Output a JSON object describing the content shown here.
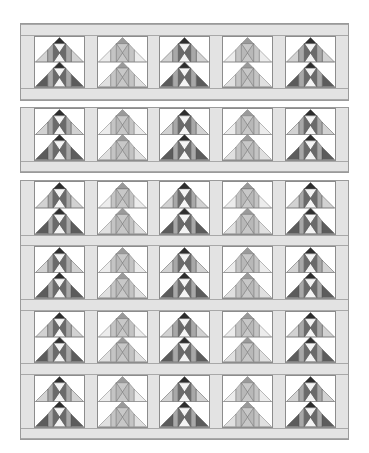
{
  "quilt": {
    "colors": {
      "background": "#ffffff",
      "sashing": "#e3e3e3",
      "sashing_border": "#9a9a9a",
      "dark": {
        "apex": "#2e2e2e",
        "hour_side": "#6a6a6a",
        "hour_tb": "#f4f4f4",
        "mid": "#a8a8a8",
        "outer": "#d2d2d2",
        "base": "#5c5c5c",
        "line": "#555555"
      },
      "light": {
        "apex": "#9a9a9a",
        "hour_side": "#b8b8b8",
        "hour_tb": "#c8c8c8",
        "mid": "#c4c4c4",
        "outer": "#ececec",
        "base": "#e0e0e0",
        "line": "#777777"
      }
    },
    "block_columns_x": [
      13,
      76,
      138,
      201,
      264
    ],
    "column_pattern": [
      "dark",
      "light",
      "dark",
      "light",
      "dark"
    ],
    "panels": [
      {
        "top": 23,
        "height": 78,
        "top_sash": 12,
        "rows": [
          {
            "y": 12,
            "h": 52
          }
        ],
        "bottom_sash_y": 64
      },
      {
        "top": 107,
        "height": 66,
        "top_sash": 0,
        "rows": [
          {
            "y": 0,
            "h": 53
          }
        ],
        "bottom_sash_y": 53
      },
      {
        "top": 180,
        "height": 260,
        "top_sash": 0,
        "rows": [
          {
            "y": 0,
            "h": 54
          },
          {
            "y": 65,
            "h": 53
          },
          {
            "y": 130,
            "h": 52
          },
          {
            "y": 194,
            "h": 53
          }
        ],
        "bottom_sash_y": 247
      }
    ]
  }
}
